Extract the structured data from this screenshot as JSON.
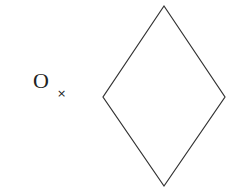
{
  "diagram": {
    "point_label": "O",
    "point_marker": "×",
    "shape": {
      "type": "rhombus",
      "vertices": {
        "top": [
          164,
          6
        ],
        "left": [
          103,
          97
        ],
        "right": [
          225,
          97
        ],
        "bottom": [
          164,
          186
        ]
      },
      "stroke": "#333333",
      "fill": "none"
    }
  }
}
